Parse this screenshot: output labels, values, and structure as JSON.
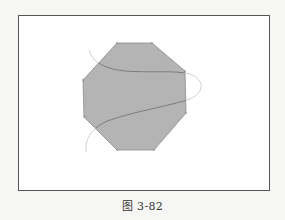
{
  "figure": {
    "caption": "图 3-82",
    "colors": {
      "background": "#f6f6f4",
      "frame_fill": "#ffffff",
      "frame_border": "#555555",
      "octagon_fill": "#b4b4b4",
      "octagon_stroke": "#8c8c8c",
      "curve_outside": "#c8c8c8",
      "curve_inside": "#6e6e6e"
    },
    "shapes": {
      "octagon": {
        "description": "gray filled octagon",
        "points": "117,43 152,43 185,71 186,113 154,150 117,150 84,117 83,80"
      },
      "curve": {
        "description": "S-shaped spline crossing the octagon",
        "path": "M89,50 C92,60 100,68 125,71 C150,73 175,70 190,74 C205,80 205,92 190,99 C170,106 130,112 105,122 C90,130 85,140 86,152"
      }
    }
  }
}
